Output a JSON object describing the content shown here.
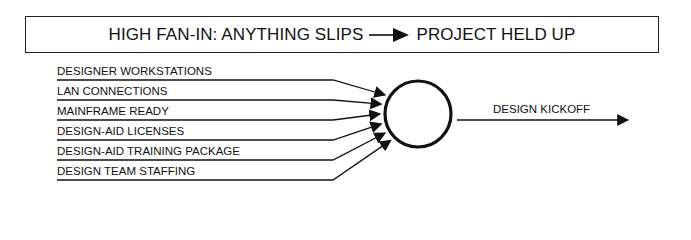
{
  "header": {
    "left_text": "HIGH FAN-IN: ANYTHING SLIPS",
    "arrow_icon": "right-arrow-icon",
    "right_text": "PROJECT HELD UP"
  },
  "diagram": {
    "node": {
      "shape": "circle",
      "label": ""
    },
    "inputs": [
      {
        "label": "DESIGNER WORKSTATIONS"
      },
      {
        "label": "LAN CONNECTIONS"
      },
      {
        "label": "MAINFRAME READY"
      },
      {
        "label": "DESIGN-AID LICENSES"
      },
      {
        "label": "DESIGN-AID TRAINING PACKAGE"
      },
      {
        "label": "DESIGN TEAM STAFFING"
      }
    ],
    "output": {
      "label": "DESIGN KICKOFF"
    }
  }
}
